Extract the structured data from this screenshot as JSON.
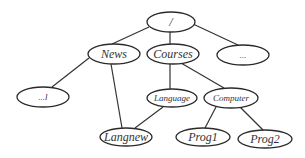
{
  "diagram": {
    "type": "tree",
    "colors": {
      "line": "#333333",
      "node_fill": "#ffffff",
      "text": "#333333"
    },
    "nodes": [
      {
        "id": "root",
        "label": "/",
        "cx": 171,
        "cy": 22,
        "rx": 24,
        "ry": 10,
        "size": "lg"
      },
      {
        "id": "news",
        "label": "News",
        "cx": 114,
        "cy": 54,
        "rx": 26,
        "ry": 10,
        "size": "lg"
      },
      {
        "id": "courses",
        "label": "Courses",
        "cx": 173,
        "cy": 54,
        "rx": 26,
        "ry": 10,
        "size": "lg"
      },
      {
        "id": "more",
        "label": "...",
        "cx": 243,
        "cy": 55,
        "rx": 26,
        "ry": 10,
        "size": "sm"
      },
      {
        "id": "dots",
        "label": "...l",
        "cx": 43,
        "cy": 97,
        "rx": 26,
        "ry": 10,
        "size": "sm"
      },
      {
        "id": "language",
        "label": "Language",
        "cx": 172,
        "cy": 98,
        "rx": 25,
        "ry": 9,
        "size": "sm"
      },
      {
        "id": "computer",
        "label": "Computer",
        "cx": 231,
        "cy": 98,
        "rx": 27,
        "ry": 10,
        "size": "sm"
      },
      {
        "id": "langnew",
        "label": "Langnew",
        "cx": 126,
        "cy": 137,
        "rx": 26,
        "ry": 9,
        "size": "lg"
      },
      {
        "id": "prog1",
        "label": "Prog1",
        "cx": 203,
        "cy": 137,
        "rx": 27,
        "ry": 9,
        "size": "lg"
      },
      {
        "id": "prog2",
        "label": "Prog2",
        "cx": 265,
        "cy": 139,
        "rx": 27,
        "ry": 9,
        "size": "lg"
      }
    ],
    "edges": [
      {
        "from": "root",
        "to": "news",
        "x1": 149,
        "y1": 27,
        "x2": 112,
        "y2": 44
      },
      {
        "from": "root",
        "to": "courses",
        "x1": 170,
        "y1": 32,
        "x2": 170,
        "y2": 44
      },
      {
        "from": "root",
        "to": "more",
        "x1": 193,
        "y1": 24,
        "x2": 238,
        "y2": 45
      },
      {
        "from": "news",
        "to": "dots",
        "x1": 89,
        "y1": 58,
        "x2": 52,
        "y2": 87
      },
      {
        "from": "news",
        "to": "langnew",
        "x1": 111,
        "y1": 64,
        "x2": 122,
        "y2": 128
      },
      {
        "from": "courses",
        "to": "language",
        "x1": 170,
        "y1": 64,
        "x2": 170,
        "y2": 89
      },
      {
        "from": "courses",
        "to": "computer",
        "x1": 181,
        "y1": 63,
        "x2": 224,
        "y2": 88
      },
      {
        "from": "language",
        "to": "langnew",
        "x1": 163,
        "y1": 107,
        "x2": 135,
        "y2": 128
      },
      {
        "from": "computer",
        "to": "prog1",
        "x1": 216,
        "y1": 107,
        "x2": 205,
        "y2": 128
      },
      {
        "from": "computer",
        "to": "prog2",
        "x1": 240,
        "y1": 107,
        "x2": 263,
        "y2": 130
      }
    ]
  }
}
